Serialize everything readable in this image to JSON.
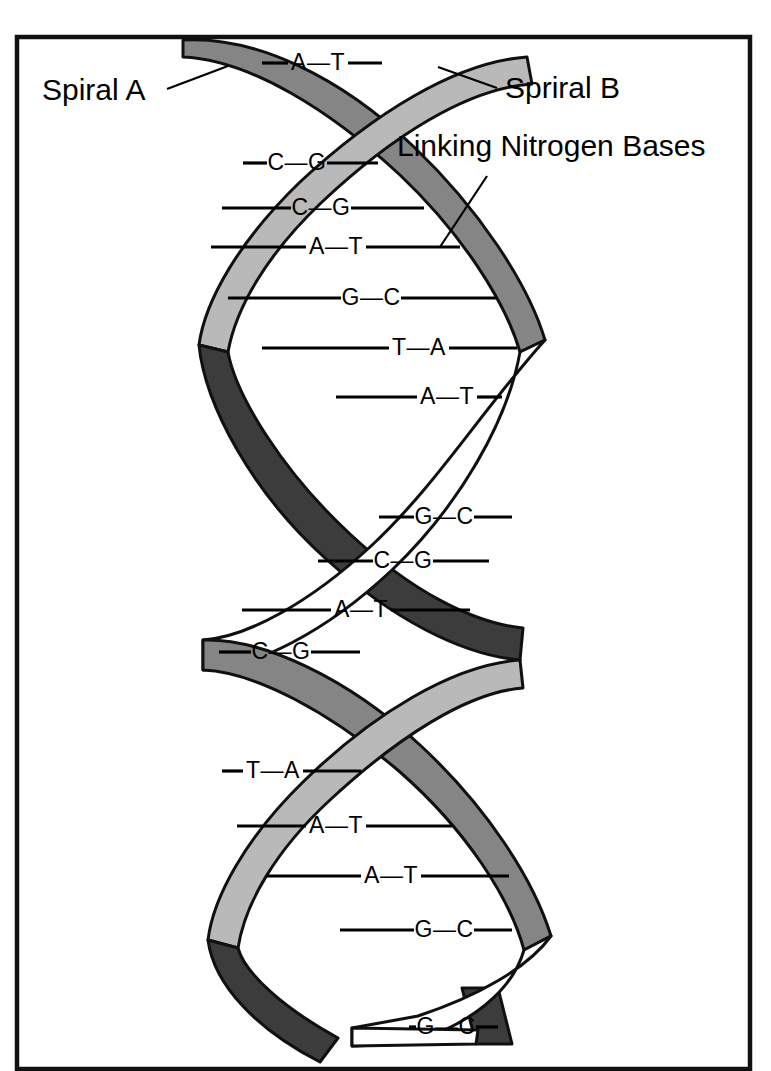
{
  "figure": {
    "background_color": "#ffffff",
    "frame_color": "#111111"
  },
  "colors": {
    "strand_light": "#b9b9b9",
    "strand_mid": "#858585",
    "strand_dark": "#3c3c3c",
    "strand_white": "#ffffff",
    "line": "#000000"
  },
  "callouts": [
    {
      "id": "spiral-a",
      "label": "Spiral A",
      "x": 42,
      "y": 92
    },
    {
      "id": "spiral-b",
      "label": "Spriral B",
      "x": 505,
      "y": 90
    },
    {
      "id": "linking-nitrogen-bases",
      "label": "Linking Nitrogen Bases",
      "x": 397,
      "y": 148
    }
  ],
  "base_pairs": [
    {
      "index": 1,
      "label": "A—T",
      "left": "A",
      "right": "T",
      "y": 63,
      "x": 318,
      "line_left": 262,
      "line_right": 382
    },
    {
      "index": 2,
      "label": "C—G",
      "left": "C",
      "right": "G",
      "y": 163,
      "x": 297,
      "line_left": 243,
      "line_right": 378
    },
    {
      "index": 3,
      "label": "C—G",
      "left": "C",
      "right": "G",
      "y": 208,
      "x": 321,
      "line_left": 222,
      "line_right": 424
    },
    {
      "index": 4,
      "label": "A—T",
      "left": "A",
      "right": "T",
      "y": 247,
      "x": 336,
      "line_left": 211,
      "line_right": 460
    },
    {
      "index": 5,
      "label": "G—C",
      "left": "G",
      "right": "C",
      "y": 298,
      "x": 371,
      "line_left": 228,
      "line_right": 497
    },
    {
      "index": 6,
      "label": "T—A",
      "left": "T",
      "right": "A",
      "y": 348,
      "x": 419,
      "line_left": 262,
      "line_right": 517
    },
    {
      "index": 7,
      "label": "A—T",
      "left": "A",
      "right": "T",
      "y": 397,
      "x": 447,
      "line_left": 336,
      "line_right": 502
    },
    {
      "index": 8,
      "label": "G—C",
      "left": "G",
      "right": "C",
      "y": 517,
      "x": 444,
      "line_left": 379,
      "line_right": 512
    },
    {
      "index": 9,
      "label": "C—G",
      "left": "C",
      "right": "G",
      "y": 561,
      "x": 403,
      "line_left": 318,
      "line_right": 489
    },
    {
      "index": 10,
      "label": "A—T",
      "left": "A",
      "right": "T",
      "y": 610,
      "x": 361,
      "line_left": 242,
      "line_right": 470
    },
    {
      "index": 11,
      "label": "C—G",
      "left": "C",
      "right": "G",
      "y": 652,
      "x": 281,
      "line_left": 219,
      "line_right": 360
    },
    {
      "index": 12,
      "label": "T—A",
      "left": "T",
      "right": "A",
      "y": 771,
      "x": 273,
      "line_left": 222,
      "line_right": 361
    },
    {
      "index": 13,
      "label": "A—T",
      "left": "A",
      "right": "T",
      "y": 826,
      "x": 336,
      "line_left": 237,
      "line_right": 452
    },
    {
      "index": 14,
      "label": "A—T",
      "left": "A",
      "right": "T",
      "y": 876,
      "x": 391,
      "line_left": 267,
      "line_right": 509
    },
    {
      "index": 15,
      "label": "G—C",
      "left": "G",
      "right": "C",
      "y": 930,
      "x": 444,
      "line_left": 340,
      "line_right": 512
    },
    {
      "index": 16,
      "label": "G—C",
      "left": "G",
      "right": "C",
      "y": 1027,
      "x": 446,
      "line_left": 409,
      "line_right": 498
    }
  ],
  "sequence_summary": {
    "strand_a": "A C C A G T A G C A C T A A G G",
    "strand_b": "T G G T C A T C G T G A T T C C",
    "pair_count": 16
  }
}
